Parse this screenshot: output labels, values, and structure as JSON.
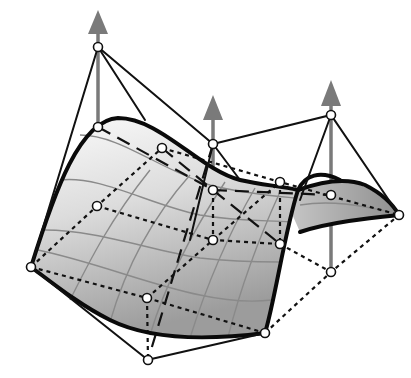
{
  "diagram": {
    "type": "bezier-surface-control-net",
    "colors": {
      "background": "#ffffff",
      "surface_light": "#f2f2f2",
      "surface_dark": "#9a9a9a",
      "edge": "#0a0a0a",
      "grid": "#8a8a8a",
      "vector": "#7a7a7a",
      "control_point_fill": "#ffffff"
    },
    "control_points": [
      {
        "id": "p1",
        "x": 98,
        "y": 47
      },
      {
        "id": "p2",
        "x": 98,
        "y": 127
      },
      {
        "id": "p3",
        "x": 97,
        "y": 206
      },
      {
        "id": "p4",
        "x": 31,
        "y": 267
      },
      {
        "id": "p5",
        "x": 162,
        "y": 148
      },
      {
        "id": "p6",
        "x": 147,
        "y": 298
      },
      {
        "id": "p7",
        "x": 148,
        "y": 360
      },
      {
        "id": "p8",
        "x": 213,
        "y": 144
      },
      {
        "id": "p9",
        "x": 213,
        "y": 190
      },
      {
        "id": "p10",
        "x": 213,
        "y": 240
      },
      {
        "id": "p11",
        "x": 280,
        "y": 182
      },
      {
        "id": "p12",
        "x": 280,
        "y": 244
      },
      {
        "id": "p13",
        "x": 265,
        "y": 333
      },
      {
        "id": "p14",
        "x": 331,
        "y": 115
      },
      {
        "id": "p15",
        "x": 331,
        "y": 195
      },
      {
        "id": "p16",
        "x": 331,
        "y": 272
      },
      {
        "id": "p17",
        "x": 399,
        "y": 215
      }
    ],
    "vectors": [
      {
        "id": "weight-vector-left",
        "x": 98,
        "base_y": 185,
        "tip_y": 10
      },
      {
        "id": "weight-vector-middle",
        "x": 213,
        "base_y": 240,
        "tip_y": 95
      },
      {
        "id": "weight-vector-right",
        "x": 331,
        "base_y": 272,
        "tip_y": 80
      }
    ]
  }
}
